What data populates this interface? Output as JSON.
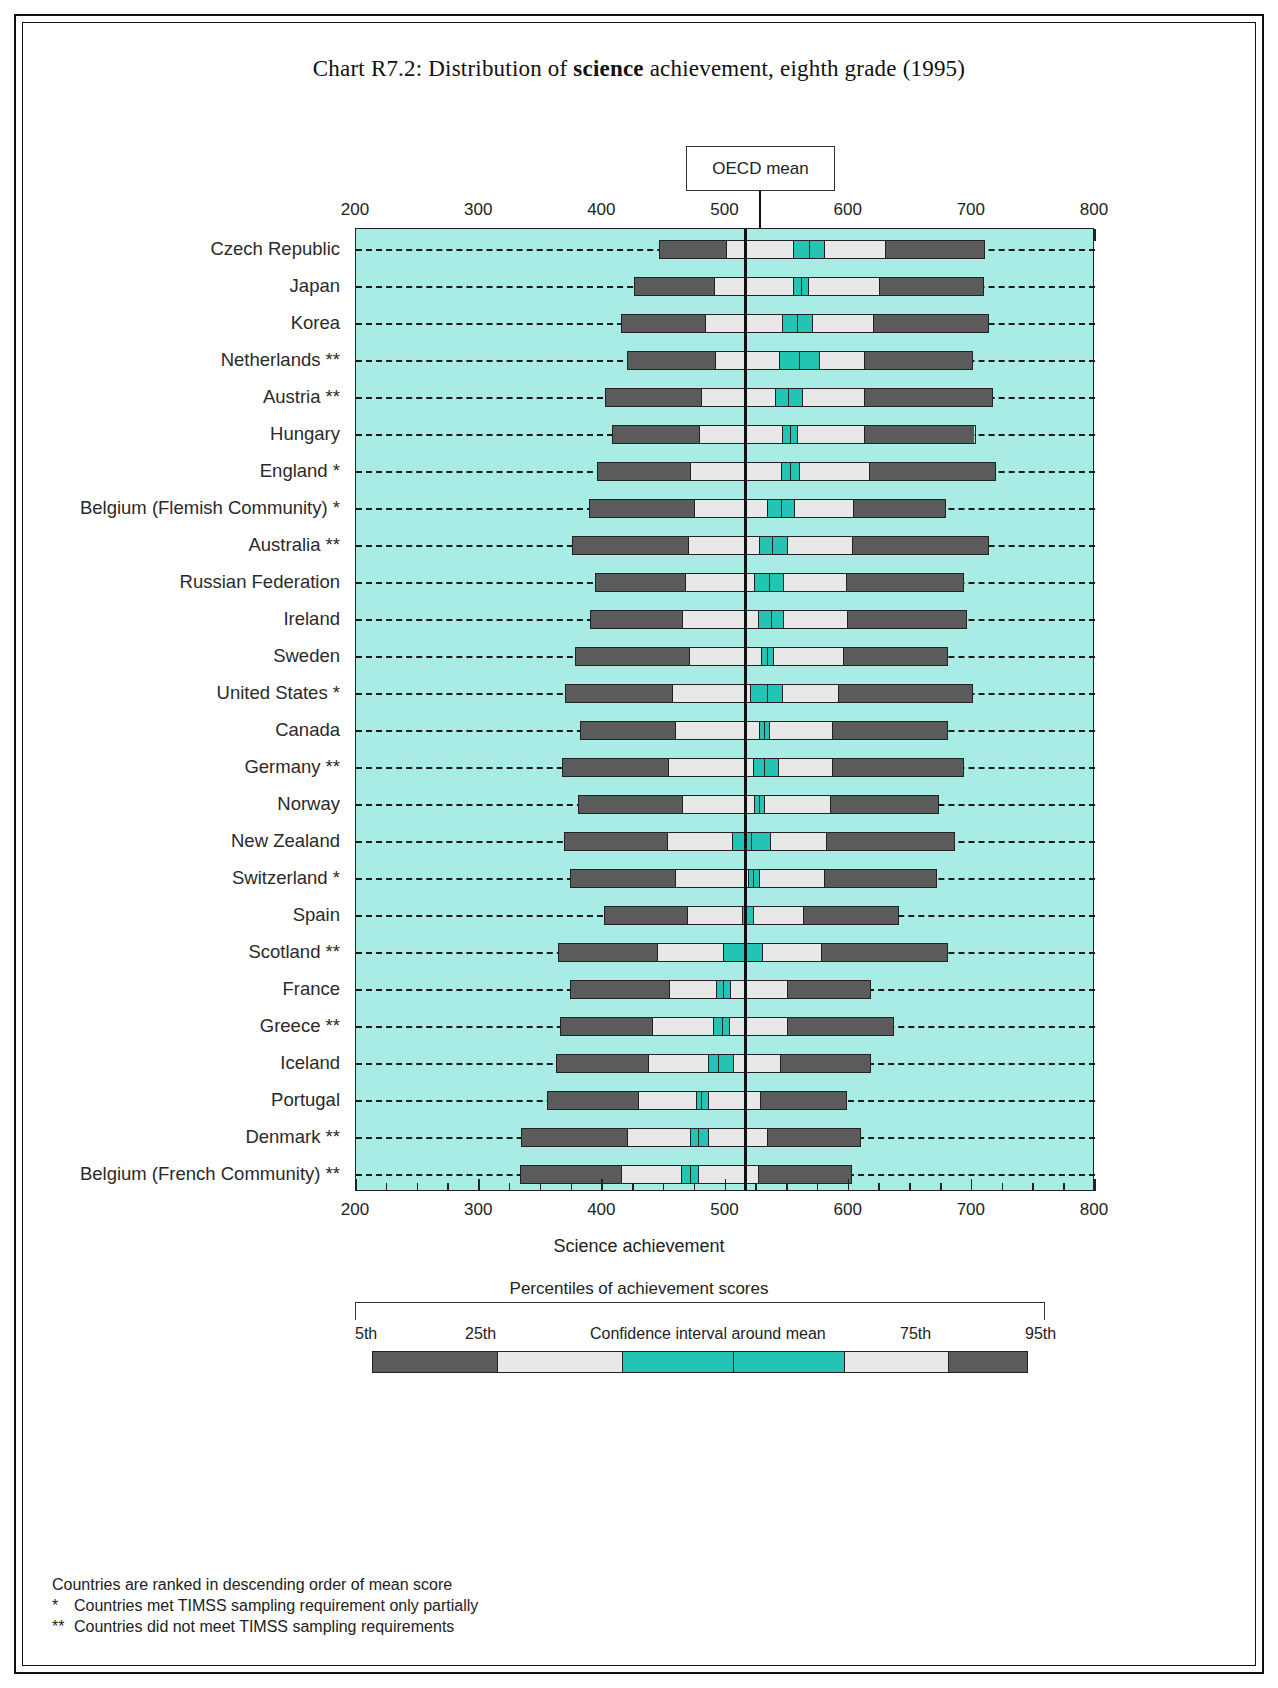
{
  "title_prefix": "Chart R7.2: Distribution of ",
  "title_bold": "science",
  "title_suffix": " achievement, eighth grade (1995)",
  "oecd_label": "OECD mean",
  "axis_title": "Science achievement",
  "legend": {
    "heading": "Percentiles of achievement scores",
    "p5": "5th",
    "p25": "25th",
    "ci": "Confidence interval around mean",
    "p75": "75th",
    "p95": "95th"
  },
  "notes": {
    "rank": "Countries are ranked in descending order of mean score",
    "star1_mark": "*",
    "star1": "Countries met TIMSS sampling requirement only partially",
    "star2_mark": "**",
    "star2": "Countries did not meet TIMSS sampling requirements"
  },
  "chart_data": {
    "type": "bar",
    "title": "Chart R7.2: Distribution of science achievement, eighth grade (1995)",
    "xlabel": "Science achievement",
    "ylabel": "",
    "xlim": [
      200,
      800
    ],
    "xticks": [
      200,
      300,
      400,
      500,
      600,
      700,
      800
    ],
    "minor_tick_step": 25,
    "grid": false,
    "oecd_mean": 516,
    "colors": {
      "background": "#a9ebe5",
      "outer_percentile": "#5b5b5b",
      "inner_percentile": "#e8e8e8",
      "confidence_interval": "#23c4b4"
    },
    "series_note": "Each bar spans the 5th to 95th percentile; inner light band 25th-75th; teal band is the confidence interval around the mean, split at the mean.",
    "categories": [
      "Czech Republic",
      "Japan",
      "Korea",
      "Netherlands **",
      "Austria **",
      "Hungary",
      "England *",
      "Belgium (Flemish Community) *",
      "Australia **",
      "Russian Federation",
      "Ireland",
      "Sweden",
      "United States *",
      "Canada",
      "Germany **",
      "Norway",
      "New Zealand",
      "Switzerland *",
      "Spain",
      "Scotland **",
      "France",
      "Greece **",
      "Iceland",
      "Portugal",
      "Denmark **",
      "Belgium (French Community) **"
    ],
    "data": [
      {
        "country": "Czech Republic",
        "p5": 446,
        "p25": 500,
        "ci_low": 555,
        "mean": 568,
        "ci_high": 580,
        "p75": 630,
        "p95": 711
      },
      {
        "country": "Japan",
        "p5": 426,
        "p25": 490,
        "ci_low": 555,
        "mean": 561,
        "ci_high": 567,
        "p75": 625,
        "p95": 710
      },
      {
        "country": "Korea",
        "p5": 415,
        "p25": 483,
        "ci_low": 546,
        "mean": 558,
        "ci_high": 570,
        "p75": 620,
        "p95": 714
      },
      {
        "country": "Netherlands **",
        "p5": 420,
        "p25": 491,
        "ci_low": 543,
        "mean": 560,
        "ci_high": 576,
        "p75": 613,
        "p95": 701
      },
      {
        "country": "Austria **",
        "p5": 402,
        "p25": 480,
        "ci_low": 540,
        "mean": 551,
        "ci_high": 562,
        "p75": 613,
        "p95": 717
      },
      {
        "country": "Hungary",
        "p5": 408,
        "p25": 478,
        "ci_low": 546,
        "mean": 552,
        "ci_high": 558,
        "p75": 613,
        "p95": 703
      },
      {
        "country": "England *",
        "p5": 396,
        "p25": 471,
        "ci_low": 545,
        "mean": 552,
        "ci_high": 560,
        "p75": 617,
        "p95": 720
      },
      {
        "country": "Belgium (Flemish Community) *",
        "p5": 389,
        "p25": 474,
        "ci_low": 534,
        "mean": 545,
        "ci_high": 556,
        "p75": 604,
        "p95": 679
      },
      {
        "country": "Australia **",
        "p5": 375,
        "p25": 469,
        "ci_low": 527,
        "mean": 538,
        "ci_high": 550,
        "p75": 603,
        "p95": 714
      },
      {
        "country": "Russian Federation",
        "p5": 394,
        "p25": 467,
        "ci_low": 523,
        "mean": 535,
        "ci_high": 547,
        "p75": 598,
        "p95": 694
      },
      {
        "country": "Ireland",
        "p5": 390,
        "p25": 464,
        "ci_low": 526,
        "mean": 537,
        "ci_high": 547,
        "p75": 599,
        "p95": 696
      },
      {
        "country": "Sweden",
        "p5": 378,
        "p25": 470,
        "ci_low": 529,
        "mean": 534,
        "ci_high": 539,
        "p75": 596,
        "p95": 681
      },
      {
        "country": "United States *",
        "p5": 370,
        "p25": 456,
        "ci_low": 520,
        "mean": 534,
        "ci_high": 546,
        "p75": 592,
        "p95": 701
      },
      {
        "country": "Canada",
        "p5": 382,
        "p25": 459,
        "ci_low": 527,
        "mean": 531,
        "ci_high": 535,
        "p75": 587,
        "p95": 681
      },
      {
        "country": "Germany **",
        "p5": 367,
        "p25": 453,
        "ci_low": 522,
        "mean": 531,
        "ci_high": 543,
        "p75": 587,
        "p95": 694
      },
      {
        "country": "Norway",
        "p5": 380,
        "p25": 464,
        "ci_low": 523,
        "mean": 527,
        "ci_high": 531,
        "p75": 585,
        "p95": 673
      },
      {
        "country": "New Zealand",
        "p5": 369,
        "p25": 452,
        "ci_low": 505,
        "mean": 521,
        "ci_high": 536,
        "p75": 582,
        "p95": 686
      },
      {
        "country": "Switzerland *",
        "p5": 374,
        "p25": 459,
        "ci_low": 518,
        "mean": 522,
        "ci_high": 527,
        "p75": 580,
        "p95": 672
      },
      {
        "country": "Spain",
        "p5": 401,
        "p25": 468,
        "ci_low": 513,
        "mean": 517,
        "ci_high": 522,
        "p75": 563,
        "p95": 641
      },
      {
        "country": "Scotland **",
        "p5": 364,
        "p25": 444,
        "ci_low": 498,
        "mean": 517,
        "ci_high": 530,
        "p75": 578,
        "p95": 681
      },
      {
        "country": "France",
        "p5": 374,
        "p25": 454,
        "ci_low": 492,
        "mean": 498,
        "ci_high": 504,
        "p75": 550,
        "p95": 618
      },
      {
        "country": "Greece **",
        "p5": 366,
        "p25": 440,
        "ci_low": 490,
        "mean": 497,
        "ci_high": 503,
        "p75": 550,
        "p95": 637
      },
      {
        "country": "Iceland",
        "p5": 362,
        "p25": 437,
        "ci_low": 486,
        "mean": 494,
        "ci_high": 506,
        "p75": 545,
        "p95": 618
      },
      {
        "country": "Portugal",
        "p5": 355,
        "p25": 429,
        "ci_low": 476,
        "mean": 480,
        "ci_high": 486,
        "p75": 528,
        "p95": 599
      },
      {
        "country": "Denmark **",
        "p5": 334,
        "p25": 420,
        "ci_low": 471,
        "mean": 478,
        "ci_high": 486,
        "p75": 534,
        "p95": 610
      },
      {
        "country": "Belgium (French Community) **",
        "p5": 333,
        "p25": 415,
        "ci_low": 464,
        "mean": 471,
        "ci_high": 478,
        "p75": 527,
        "p95": 603
      }
    ]
  }
}
